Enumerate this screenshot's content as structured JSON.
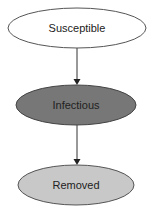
{
  "diagram": {
    "nodes": [
      {
        "id": "susceptible",
        "label": "Susceptible",
        "fill": "#ffffff"
      },
      {
        "id": "infectious",
        "label": "Infectious",
        "fill": "#777777"
      },
      {
        "id": "removed",
        "label": "Removed",
        "fill": "#c8c8c8"
      }
    ],
    "edges": [
      {
        "from": "susceptible",
        "to": "infectious"
      },
      {
        "from": "infectious",
        "to": "removed"
      }
    ]
  }
}
